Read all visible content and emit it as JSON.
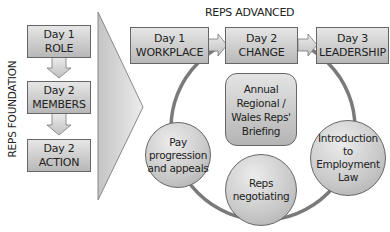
{
  "foundation": {
    "label": "REPS FOUNDATION",
    "steps": [
      {
        "day": "Day 1",
        "title": "ROLE"
      },
      {
        "day": "Day 2",
        "title": "MEMBERS"
      },
      {
        "day": "Day 2",
        "title": "ACTION"
      }
    ]
  },
  "advanced": {
    "label": "REPS ADVANCED",
    "steps": [
      {
        "day": "Day 1",
        "title": "WORKPLACE"
      },
      {
        "day": "Day 2",
        "title": "CHANGE"
      },
      {
        "day": "Day 3",
        "title": "LEADERSHIP"
      }
    ],
    "central": {
      "lines": [
        "Annual",
        "Regional /",
        "Wales Reps'",
        "Briefing"
      ]
    },
    "modules": [
      {
        "lines": [
          "Pay",
          "progression",
          "and appeals"
        ]
      },
      {
        "lines": [
          "Reps",
          "negotiating"
        ]
      },
      {
        "lines": [
          "Introduction",
          "to",
          "Employment",
          "Law"
        ]
      }
    ]
  },
  "colors": {
    "box_top": "#e6e6e6",
    "box_bottom": "#b8b8b8",
    "border": "#666666",
    "connector": "#777777",
    "arrow_fill": "#d4d4d4"
  }
}
